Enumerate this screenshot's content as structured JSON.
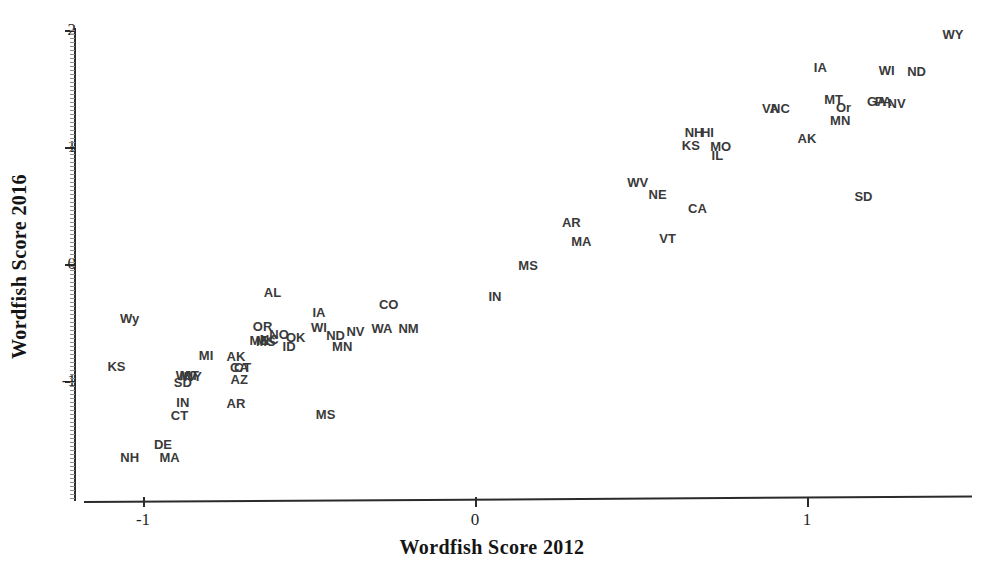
{
  "chart_data": {
    "type": "scatter",
    "title": "",
    "xlabel": "Wordfish Score 2012",
    "ylabel": "Wordfish Score 2016",
    "xlim": [
      -1.32,
      1.52
    ],
    "ylim": [
      -1.55,
      2.05
    ],
    "grid": false,
    "legend": null,
    "point_style": "text-label",
    "xticks": [
      -1,
      0,
      1
    ],
    "xticklabels": [
      "-1",
      "0",
      "1"
    ],
    "yticks": [
      -1,
      0,
      1,
      2
    ],
    "yticklabels": [
      "-1",
      "0",
      "1",
      "2"
    ],
    "label_color": "#3a3a3a",
    "axis_color": "#2b2b2b",
    "points": [
      {
        "label": "WY",
        "x": 1.44,
        "y": 1.97
      },
      {
        "label": "IA",
        "x": 1.04,
        "y": 1.68
      },
      {
        "label": "WI",
        "x": 1.24,
        "y": 1.66
      },
      {
        "label": "ND",
        "x": 1.33,
        "y": 1.65
      },
      {
        "label": "GA",
        "x": 1.21,
        "y": 1.39
      },
      {
        "label": "PA",
        "x": 1.23,
        "y": 1.39
      },
      {
        "label": "NV",
        "x": 1.27,
        "y": 1.38
      },
      {
        "label": "MT",
        "x": 1.08,
        "y": 1.41
      },
      {
        "label": "Or",
        "x": 1.11,
        "y": 1.34
      },
      {
        "label": "VA",
        "x": 0.89,
        "y": 1.33
      },
      {
        "label": "NC",
        "x": 0.92,
        "y": 1.33
      },
      {
        "label": "MN",
        "x": 1.1,
        "y": 1.23
      },
      {
        "label": "NH",
        "x": 0.66,
        "y": 1.13
      },
      {
        "label": "HI",
        "x": 0.7,
        "y": 1.13
      },
      {
        "label": "AK",
        "x": 1.0,
        "y": 1.08
      },
      {
        "label": "KS",
        "x": 0.65,
        "y": 1.02
      },
      {
        "label": "MO",
        "x": 0.74,
        "y": 1.01
      },
      {
        "label": "IL",
        "x": 0.73,
        "y": 0.93
      },
      {
        "label": "WV",
        "x": 0.49,
        "y": 0.7
      },
      {
        "label": "NE",
        "x": 0.55,
        "y": 0.6
      },
      {
        "label": "CA",
        "x": 0.67,
        "y": 0.48
      },
      {
        "label": "SD",
        "x": 1.17,
        "y": 0.58
      },
      {
        "label": "AR",
        "x": 0.29,
        "y": 0.36
      },
      {
        "label": "MA",
        "x": 0.32,
        "y": 0.2
      },
      {
        "label": "VT",
        "x": 0.58,
        "y": 0.22
      },
      {
        "label": "MS",
        "x": 0.16,
        "y": -0.01
      },
      {
        "label": "IN",
        "x": 0.06,
        "y": -0.27
      },
      {
        "label": "CO",
        "x": -0.26,
        "y": -0.34
      },
      {
        "label": "AL",
        "x": -0.61,
        "y": -0.24
      },
      {
        "label": "IA",
        "x": -0.47,
        "y": -0.41
      },
      {
        "label": "NM",
        "x": -0.2,
        "y": -0.55
      },
      {
        "label": "WA",
        "x": -0.28,
        "y": -0.55
      },
      {
        "label": "NV",
        "x": -0.36,
        "y": -0.57
      },
      {
        "label": "WI",
        "x": -0.47,
        "y": -0.54
      },
      {
        "label": "OR",
        "x": -0.64,
        "y": -0.53
      },
      {
        "label": "ND",
        "x": -0.42,
        "y": -0.61
      },
      {
        "label": "OK",
        "x": -0.54,
        "y": -0.62
      },
      {
        "label": "NO",
        "x": -0.59,
        "y": -0.6
      },
      {
        "label": "NC",
        "x": -0.62,
        "y": -0.64
      },
      {
        "label": "ME",
        "x": -0.65,
        "y": -0.65
      },
      {
        "label": "MS",
        "x": -0.63,
        "y": -0.66
      },
      {
        "label": "ID",
        "x": -0.56,
        "y": -0.7
      },
      {
        "label": "MN",
        "x": -0.4,
        "y": -0.7
      },
      {
        "label": "MI",
        "x": -0.81,
        "y": -0.78
      },
      {
        "label": "AK",
        "x": -0.72,
        "y": -0.79
      },
      {
        "label": "CA",
        "x": -0.71,
        "y": -0.88
      },
      {
        "label": "CT",
        "x": -0.7,
        "y": -0.88
      },
      {
        "label": "AZ",
        "x": -0.71,
        "y": -0.98
      },
      {
        "label": "MT",
        "x": -0.86,
        "y": -0.95
      },
      {
        "label": "WV",
        "x": -0.87,
        "y": -0.95
      },
      {
        "label": "NY",
        "x": -0.85,
        "y": -0.96
      },
      {
        "label": "SD",
        "x": -0.88,
        "y": -1.01
      },
      {
        "label": "IN",
        "x": -0.88,
        "y": -1.18
      },
      {
        "label": "AR",
        "x": -0.72,
        "y": -1.19
      },
      {
        "label": "CT",
        "x": -0.89,
        "y": -1.29
      },
      {
        "label": "MS",
        "x": -0.45,
        "y": -1.28
      },
      {
        "label": "Wy",
        "x": -1.04,
        "y": -0.46
      },
      {
        "label": "KS",
        "x": -1.08,
        "y": -0.87
      },
      {
        "label": "DE",
        "x": -0.94,
        "y": -1.54
      },
      {
        "label": "NH",
        "x": -1.04,
        "y": -1.65
      },
      {
        "label": "MA",
        "x": -0.92,
        "y": -1.65
      }
    ]
  }
}
